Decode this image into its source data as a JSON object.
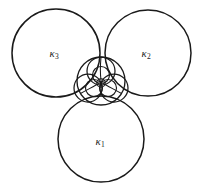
{
  "figure": {
    "background_color": "#ffffff",
    "stroke_color": "#1a1a1a",
    "width": 202,
    "height": 194,
    "labels": [
      {
        "id": "k1",
        "symbol": "κ",
        "subscript": "1",
        "x": 100,
        "y": 142
      },
      {
        "id": "k2",
        "symbol": "κ",
        "subscript": "2",
        "x": 146,
        "y": 54
      },
      {
        "id": "k3",
        "symbol": "κ",
        "subscript": "3",
        "x": 54,
        "y": 54
      }
    ]
  },
  "chart_data": {
    "type": "diagram",
    "xlabel": "",
    "ylabel": "",
    "xlim": [
      0,
      202
    ],
    "ylim": [
      0,
      194
    ],
    "grid": false,
    "legend": "none",
    "annotations": [
      {
        "text": "κ₁",
        "x": 100,
        "y": 142
      },
      {
        "text": "κ₂",
        "x": 146,
        "y": 54
      },
      {
        "text": "κ₃",
        "x": 54,
        "y": 54
      }
    ],
    "circles": [
      {
        "name": "kappa-3",
        "cx": 56,
        "cy": 53,
        "r": 44,
        "role": "outer-generator"
      },
      {
        "name": "kappa-2",
        "cx": 148,
        "cy": 53,
        "r": 43,
        "role": "outer-generator"
      },
      {
        "name": "kappa-1",
        "cx": 101,
        "cy": 139,
        "r": 43,
        "role": "outer-generator"
      },
      {
        "name": "inner-soddy",
        "cx": 101,
        "cy": 81,
        "r": 24,
        "role": "inner-soddy"
      },
      {
        "name": "mid-top",
        "cx": 101,
        "cy": 71,
        "r": 14,
        "role": "second-generation"
      },
      {
        "name": "mid-left",
        "cx": 88,
        "cy": 88,
        "r": 14,
        "role": "second-generation"
      },
      {
        "name": "mid-right",
        "cx": 114,
        "cy": 88,
        "r": 14,
        "role": "second-generation"
      },
      {
        "name": "small-top",
        "cx": 101,
        "cy": 75,
        "r": 8.5,
        "role": "third-generation"
      },
      {
        "name": "small-left",
        "cx": 94,
        "cy": 88,
        "r": 8.5,
        "role": "third-generation"
      },
      {
        "name": "small-right",
        "cx": 108,
        "cy": 88,
        "r": 8.5,
        "role": "third-generation"
      },
      {
        "name": "tiny-center",
        "cx": 101,
        "cy": 83,
        "r": 4.2,
        "role": "fourth-generation"
      }
    ],
    "arcs": [
      {
        "name": "cusp-line-up",
        "from": [
          101,
          57
        ],
        "to": [
          101,
          83
        ]
      },
      {
        "name": "cusp-line-left",
        "from": [
          79,
          97
        ],
        "to": [
          101,
          83
        ]
      },
      {
        "name": "cusp-line-right",
        "from": [
          123,
          97
        ],
        "to": [
          101,
          83
        ]
      }
    ]
  }
}
